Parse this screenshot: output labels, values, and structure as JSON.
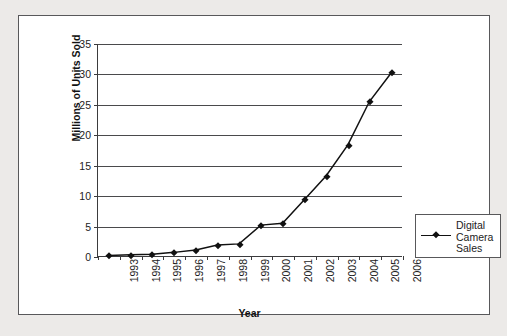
{
  "chart_data": {
    "type": "line",
    "title": "",
    "xlabel": "Year",
    "ylabel": "Millions of Units Sold",
    "categories": [
      "1993",
      "1994",
      "1995",
      "1996",
      "1997",
      "1998",
      "1999",
      "2000",
      "2001",
      "2002",
      "2003",
      "2004",
      "2005",
      "2006"
    ],
    "series": [
      {
        "name": "Digital Camera Sales",
        "values": [
          0.1,
          0.2,
          0.3,
          0.6,
          1.0,
          1.8,
          2.0,
          5.1,
          5.4,
          9.3,
          13.2,
          18.3,
          25.5,
          30.2
        ],
        "marker": "diamond",
        "color": "#111111"
      }
    ],
    "ylim": [
      0,
      35
    ],
    "yticks": [
      0,
      5,
      10,
      15,
      20,
      25,
      30,
      35
    ],
    "grid": "horizontal",
    "legend_position": "right",
    "legend_entries": [
      "Digital Camera Sales"
    ]
  },
  "legend": {
    "label_lines": [
      "Digital",
      "Camera",
      "Sales"
    ]
  },
  "axes": {
    "x_title": "Year",
    "y_title": "Millions of Units Sold"
  }
}
